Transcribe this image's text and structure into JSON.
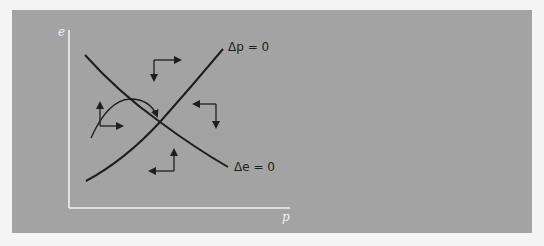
{
  "diagram": {
    "type": "phase-diagram",
    "x_axis_label": "p",
    "y_axis_label": "e",
    "curves": [
      {
        "name": "delta-p-zero",
        "label": "Δp = 0",
        "shape": "upward-sloping, convex"
      },
      {
        "name": "delta-e-zero",
        "label": "Δe = 0",
        "shape": "downward-sloping, convex"
      }
    ],
    "direction_arrows": [
      {
        "region": "top",
        "horizontal": "right",
        "vertical": "down"
      },
      {
        "region": "right",
        "horizontal": "left",
        "vertical": "down"
      },
      {
        "region": "bottom",
        "horizontal": "left",
        "vertical": "up"
      },
      {
        "region": "left",
        "horizontal": "right",
        "vertical": "up"
      }
    ],
    "trajectory": "curved path from lower-left rising then converging toward the intersection",
    "colors": {
      "background": "#a3a3a3",
      "axes": "#f2f2f2",
      "curves": "#1e1e1e",
      "page": "#f4f4f4"
    }
  },
  "labels": {
    "delta_p": "Δp = 0",
    "delta_e": "Δe = 0",
    "x_axis": "p",
    "y_axis": "e"
  }
}
